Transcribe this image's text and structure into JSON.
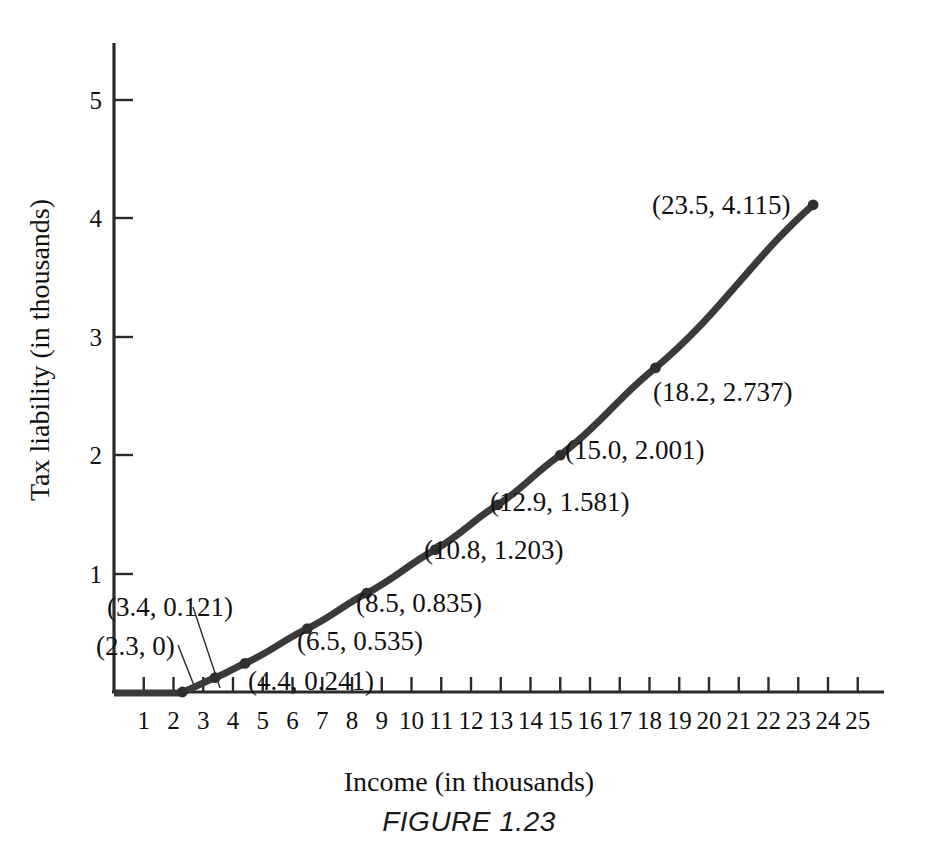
{
  "chart_data": {
    "type": "line",
    "title": "",
    "caption": "FIGURE 1.23",
    "xlabel": "Income (in thousands)",
    "ylabel": "Tax liability (in thousands)",
    "xlim": [
      0,
      26.5
    ],
    "ylim": [
      0,
      5.45
    ],
    "grid": false,
    "legend": "none",
    "x_ticks": [
      1,
      2,
      3,
      4,
      5,
      6,
      7,
      8,
      9,
      10,
      11,
      12,
      13,
      14,
      15,
      16,
      17,
      18,
      19,
      20,
      21,
      22,
      23,
      24,
      25
    ],
    "x_tick_labels": [
      "1",
      "2",
      "3",
      "4",
      "5",
      "6",
      "7",
      "8",
      "9",
      "10",
      "11",
      "12",
      "13",
      "14",
      "15",
      "16",
      "17",
      "18",
      "19",
      "20",
      "21",
      "22",
      "23",
      "24",
      "25"
    ],
    "y_ticks": [
      1,
      2,
      3,
      4,
      5
    ],
    "y_tick_labels": [
      "1",
      "2",
      "3",
      "4",
      "5"
    ],
    "x": [
      0,
      2.3,
      3.4,
      4.4,
      6.5,
      8.5,
      10.8,
      12.9,
      15.0,
      18.2,
      23.5
    ],
    "y": [
      0,
      0,
      0.121,
      0.241,
      0.535,
      0.835,
      1.203,
      1.581,
      2.001,
      2.737,
      4.115
    ],
    "series": [
      {
        "name": "Tax liability",
        "color": "#3a3a3a",
        "points": [
          {
            "x": 0,
            "y": 0,
            "marker": false,
            "label": null
          },
          {
            "x": 2.3,
            "y": 0,
            "marker": true,
            "label": "(2.3, 0)"
          },
          {
            "x": 3.4,
            "y": 0.121,
            "marker": true,
            "label": "(3.4, 0.121)"
          },
          {
            "x": 4.4,
            "y": 0.241,
            "marker": true,
            "label": "(4.4, 0.241)"
          },
          {
            "x": 6.5,
            "y": 0.535,
            "marker": true,
            "label": "(6.5, 0.535)"
          },
          {
            "x": 8.5,
            "y": 0.835,
            "marker": true,
            "label": "(8.5, 0.835)"
          },
          {
            "x": 10.8,
            "y": 1.203,
            "marker": true,
            "label": "(10.8, 1.203)"
          },
          {
            "x": 12.9,
            "y": 1.581,
            "marker": true,
            "label": "(12.9, 1.581)"
          },
          {
            "x": 15.0,
            "y": 2.001,
            "marker": true,
            "label": "(15.0, 2.001)"
          },
          {
            "x": 18.2,
            "y": 2.737,
            "marker": true,
            "label": "(18.2, 2.737)"
          },
          {
            "x": 23.5,
            "y": 4.115,
            "marker": true,
            "label": "(23.5, 4.115)"
          }
        ]
      }
    ],
    "point_labels": [
      {
        "text": "(2.3, 0)",
        "px": 96,
        "py": 633,
        "leader": true
      },
      {
        "text": "(3.4, 0.121)",
        "px": 107,
        "py": 594,
        "leader": true
      },
      {
        "text": "(4.4, 0.241)",
        "px": 248,
        "py": 668,
        "leader": false
      },
      {
        "text": "(6.5, 0.535)",
        "px": 297,
        "py": 628,
        "leader": false
      },
      {
        "text": "(8.5, 0.835)",
        "px": 356,
        "py": 590,
        "leader": false
      },
      {
        "text": "(10.8, 1.203)",
        "px": 424,
        "py": 537,
        "leader": false
      },
      {
        "text": "(12.9, 1.581)",
        "px": 490,
        "py": 489,
        "leader": false
      },
      {
        "text": "(15.0, 2.001)",
        "px": 565,
        "py": 437,
        "leader": false
      },
      {
        "text": "(18.2, 2.737)",
        "px": 653,
        "py": 379,
        "leader": false
      },
      {
        "text": "(23.5, 4.115)",
        "px": 652,
        "py": 192,
        "leader": false
      }
    ]
  }
}
